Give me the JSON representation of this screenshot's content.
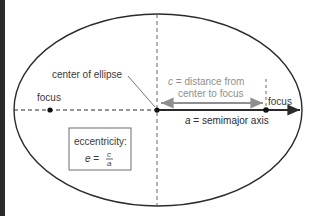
{
  "diagram": {
    "type": "ellipse-geometry",
    "labels": {
      "center": "center of ellipse",
      "focus_left": "focus",
      "focus_right": "focus",
      "c_line1": "c = distance from",
      "c_var": "c",
      "c_rest1": " = distance from",
      "c_line2": "center to focus",
      "a_var": "a",
      "a_rest": " = semimajor axis",
      "ecc_title": "eccentricity:",
      "ecc_lhs": "e",
      "ecc_eq": " = ",
      "ecc_num": "c",
      "ecc_den": "a"
    },
    "colors": {
      "stroke": "#2b2b2b",
      "gray": "#8f8f8f",
      "text": "#3a3a3a",
      "box_border": "#6e6e6e"
    }
  }
}
